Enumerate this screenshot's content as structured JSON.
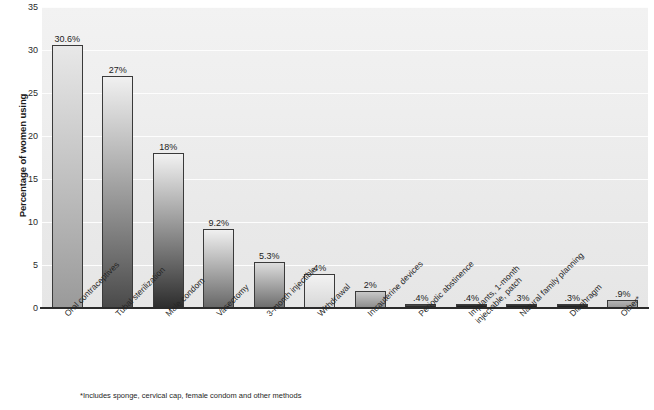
{
  "chart_data": {
    "type": "bar",
    "title": "",
    "xlabel": "",
    "ylabel": "Percentage of women using",
    "ylim": [
      0,
      35
    ],
    "yticks": [
      0,
      5,
      10,
      15,
      20,
      25,
      30,
      35
    ],
    "ytick_labels": [
      "0",
      "5",
      "10",
      "15",
      "20",
      "25",
      "30",
      "35"
    ],
    "grid": true,
    "legend": "none",
    "categories": [
      "Oral contraceptives",
      "Tubal sterilization",
      "Male condom",
      "Vasectomy",
      "3-month injectible",
      "Withdrawal",
      "Intrauterine devices",
      "Periodic abstinence",
      "Implants, 1-month injectable, patch",
      "Natural family planning",
      "Diaphragm",
      "Other*"
    ],
    "values": [
      30.6,
      27,
      18,
      9.2,
      5.3,
      4,
      2,
      0.4,
      0.4,
      0.3,
      0.3,
      0.9
    ],
    "value_labels": [
      "30.6%",
      "27%",
      "18%",
      "9.2%",
      "5.3%",
      "4%",
      "2%",
      ".4%",
      ".4%",
      ".3%",
      ".3%",
      ".9%"
    ],
    "bar_top_colors": [
      "#e8e8e8",
      "#f0f0f0",
      "#f2f2f2",
      "#f0f0f0",
      "#dcdcdc",
      "#f2f2f2",
      "#c8c8c8",
      "#555555",
      "#3a3a3a",
      "#3a3a3a",
      "#3a3a3a",
      "#b4b4b4"
    ],
    "bar_bottom_colors": [
      "#9a9a9a",
      "#4a4a4a",
      "#2e2e2e",
      "#686868",
      "#6e6e6e",
      "#d8d8d8",
      "#8e8e8e",
      "#1e1e1e",
      "#1a1a1a",
      "#1a1a1a",
      "#1a1a1a",
      "#9a9a9a"
    ],
    "footnote": "*Includes sponge, cervical cap, female condom and other methods",
    "plot_background": "#eeeeee",
    "gridline_color": "#fdfdfd",
    "axis_color": "#2b2b2b"
  },
  "x_label_lines": [
    [
      "Oral contraceptives"
    ],
    [
      "Tubal sterilization"
    ],
    [
      "Male condom"
    ],
    [
      "Vasectomy"
    ],
    [
      "3-month injectible"
    ],
    [
      "Withdrawal"
    ],
    [
      "Intrauterine devices"
    ],
    [
      "Periodic abstinence"
    ],
    [
      "Implants, 1-month",
      "injectable, patch"
    ],
    [
      "Natural family planning"
    ],
    [
      "Diaphragm"
    ],
    [
      "Other*"
    ]
  ]
}
